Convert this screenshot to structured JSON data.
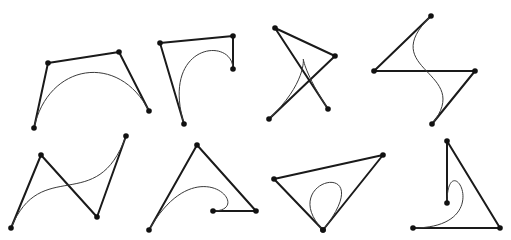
{
  "diagram": {
    "title": "",
    "colors": {
      "polygon": "#1a1a1a",
      "curve": "#3a3a3a",
      "point": "#111111",
      "background": "#ffffff"
    },
    "panels": [
      {
        "id": "panel-1",
        "shape": "arch",
        "points": [
          [
            34,
            128
          ],
          [
            48,
            63
          ],
          [
            119,
            52
          ],
          [
            149,
            111
          ]
        ]
      },
      {
        "id": "panel-2",
        "shape": "hook",
        "points": [
          [
            184,
            124
          ],
          [
            160,
            43
          ],
          [
            233,
            36
          ],
          [
            233,
            69
          ]
        ]
      },
      {
        "id": "panel-3",
        "shape": "cusp",
        "points": [
          [
            269,
            119
          ],
          [
            335,
            56
          ],
          [
            275,
            28
          ],
          [
            328,
            109
          ]
        ]
      },
      {
        "id": "panel-4",
        "shape": "s-curve",
        "points": [
          [
            431,
            16
          ],
          [
            374,
            71
          ],
          [
            475,
            71
          ],
          [
            432,
            124
          ]
        ]
      },
      {
        "id": "panel-5",
        "shape": "inflection",
        "points": [
          [
            11,
            228
          ],
          [
            41,
            155
          ],
          [
            97,
            217
          ],
          [
            126,
            136
          ]
        ]
      },
      {
        "id": "panel-6",
        "shape": "curl",
        "points": [
          [
            149,
            230
          ],
          [
            197,
            145
          ],
          [
            256,
            211
          ],
          [
            213,
            211
          ]
        ]
      },
      {
        "id": "panel-7",
        "shape": "loop",
        "points": [
          [
            323,
            230
          ],
          [
            383,
            155
          ],
          [
            274,
            179
          ],
          [
            323,
            230
          ]
        ]
      },
      {
        "id": "panel-8",
        "shape": "curl",
        "points": [
          [
            413,
            228
          ],
          [
            500,
            228
          ],
          [
            447,
            141
          ],
          [
            447,
            203
          ]
        ]
      }
    ]
  }
}
